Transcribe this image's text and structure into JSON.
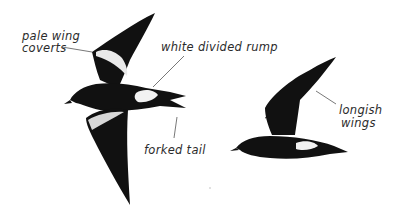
{
  "figure": {
    "labels": {
      "pale_wing_coverts_line1": "pale wing",
      "pale_wing_coverts_line2": "coverts",
      "white_divided_rump": "white divided rump",
      "forked_tail": "forked tail",
      "longish_wings_line1": "longish",
      "longish_wings_line2": "wings"
    },
    "colors": {
      "bird": "#111111",
      "highlight": "#f2f2f2",
      "leader_line": "#555555",
      "text": "#2b2b2b",
      "background": "#ffffff"
    }
  }
}
